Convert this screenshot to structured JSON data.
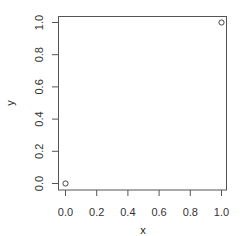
{
  "chart_data": {
    "type": "scatter",
    "title": "",
    "xlabel": "x",
    "ylabel": "y",
    "x": [
      0.0,
      1.0
    ],
    "y": [
      0.0,
      1.0
    ],
    "xlim": [
      0.0,
      1.0
    ],
    "ylim": [
      0.0,
      1.0
    ],
    "xticks": [
      "0.0",
      "0.2",
      "0.4",
      "0.6",
      "0.8",
      "1.0"
    ],
    "yticks": [
      "0.0",
      "0.2",
      "0.4",
      "0.6",
      "0.8",
      "1.0"
    ],
    "grid": false,
    "legend": null,
    "marker": "open-circle"
  },
  "colors": {
    "axis": "#555555",
    "marker": "#444444",
    "text": "#333333"
  }
}
